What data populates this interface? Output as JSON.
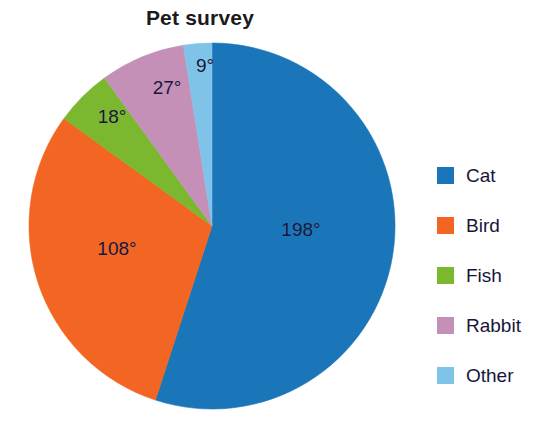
{
  "chart_data": {
    "type": "pie",
    "title": "Pet survey",
    "units": "degrees",
    "total_degrees": 360,
    "categories": [
      "Cat",
      "Bird",
      "Fish",
      "Rabbit",
      "Other"
    ],
    "values": [
      198,
      108,
      18,
      27,
      9
    ],
    "data_labels": [
      "198°",
      "108°",
      "18°",
      "27°",
      "9°"
    ],
    "colors": [
      "#1a76b8",
      "#f26522",
      "#7cb82f",
      "#c490b8",
      "#7fc4e8"
    ],
    "legend_position": "right",
    "grid": false,
    "start_angle_deg": 0,
    "direction": "clockwise",
    "slices": [
      {
        "name": "Cat",
        "value": 198,
        "label": "198°",
        "color": "#1a76b8",
        "start_deg": 0,
        "end_deg": 198,
        "label_x": 301,
        "label_y": 230
      },
      {
        "name": "Bird",
        "value": 108,
        "label": "108°",
        "color": "#f26522",
        "start_deg": 198,
        "end_deg": 306,
        "label_x": 117,
        "label_y": 249
      },
      {
        "name": "Fish",
        "value": 18,
        "label": "18°",
        "color": "#7cb82f",
        "start_deg": 306,
        "end_deg": 324,
        "label_x": 112,
        "label_y": 117
      },
      {
        "name": "Rabbit",
        "value": 27,
        "label": "27°",
        "color": "#c490b8",
        "start_deg": 324,
        "end_deg": 351,
        "label_x": 167,
        "label_y": 88
      },
      {
        "name": "Other",
        "value": 9,
        "label": "9°",
        "color": "#7fc4e8",
        "start_deg": 351,
        "end_deg": 360,
        "label_x": 205,
        "label_y": 66
      }
    ],
    "legend": [
      {
        "label": "Cat",
        "color": "#1a76b8"
      },
      {
        "label": "Bird",
        "color": "#f26522"
      },
      {
        "label": "Fish",
        "color": "#7cb82f"
      },
      {
        "label": "Rabbit",
        "color": "#c490b8"
      },
      {
        "label": "Other",
        "color": "#7fc4e8"
      }
    ],
    "geometry": {
      "center_x": 212,
      "center_y": 226,
      "radius": 183
    }
  }
}
